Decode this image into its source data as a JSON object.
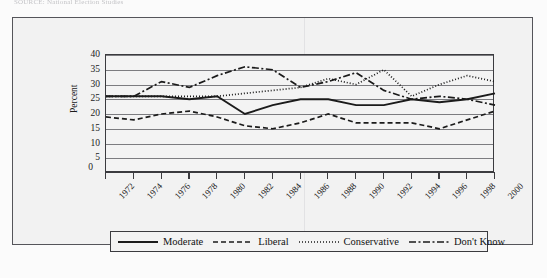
{
  "page": {
    "source_caption": "SOURCE: National Election Studies"
  },
  "axes": {
    "y_title": "Percent",
    "y_ticks": [
      40,
      35,
      30,
      25,
      20,
      15,
      10,
      5,
      0
    ],
    "zero_label": "0",
    "x_ticks": [
      "1972",
      "1974",
      "1976",
      "1978",
      "1980",
      "1982",
      "1984",
      "1986",
      "1988",
      "1990",
      "1992",
      "1994",
      "1996",
      "1998",
      "2000"
    ]
  },
  "legend": {
    "items": [
      {
        "label": "Moderate",
        "style": "solid",
        "color": "#1b1b1b"
      },
      {
        "label": "Liberal",
        "style": "dashed",
        "color": "#1b1b1b"
      },
      {
        "label": "Conservative",
        "style": "dotted",
        "color": "#1b1b1b"
      },
      {
        "label": "Don't Know",
        "style": "dashdot",
        "color": "#1b1b1b"
      }
    ]
  },
  "chart_data": {
    "type": "line",
    "title": "",
    "xlabel": "",
    "ylabel": "Percent",
    "ylim": [
      0,
      40
    ],
    "ytick_step": 5,
    "grid": true,
    "legend_position": "bottom",
    "x": [
      1972,
      1974,
      1976,
      1978,
      1980,
      1982,
      1984,
      1986,
      1988,
      1990,
      1992,
      1994,
      1996,
      1998,
      2000
    ],
    "series": [
      {
        "name": "Moderate",
        "style": "solid",
        "values": [
          26,
          26,
          26,
          25,
          26,
          20,
          23,
          25,
          25,
          23,
          23,
          25,
          24,
          25,
          27
        ]
      },
      {
        "name": "Liberal",
        "style": "dashed",
        "values": [
          19,
          18,
          20,
          21,
          19,
          16,
          15,
          17,
          20,
          17,
          17,
          17,
          15,
          18,
          21
        ]
      },
      {
        "name": "Conservative",
        "style": "dotted",
        "values": [
          26,
          26,
          26,
          26,
          26,
          27,
          28,
          29,
          32,
          30,
          35,
          26,
          30,
          33,
          31
        ]
      },
      {
        "name": "Don't Know",
        "style": "dashdot",
        "values": [
          26,
          26,
          31,
          29,
          33,
          36,
          35,
          29,
          31,
          34,
          28,
          25,
          26,
          25,
          23
        ]
      }
    ]
  }
}
